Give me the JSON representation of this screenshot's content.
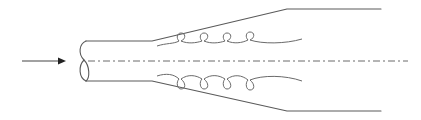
{
  "diagram": {
    "colors": {
      "stroke": "#5a5a5a",
      "coil": "#6a6a6a",
      "arrow": "#222222",
      "background": "#ffffff"
    },
    "flow_arrow": {
      "direction": "right",
      "x1": 22,
      "x2": 65,
      "y": 61
    },
    "pipe": {
      "inlet": {
        "x": 84,
        "top_y": 41,
        "bottom_y": 81,
        "cut": "wavy-section"
      },
      "straight_end_x": 152,
      "diverging_end_x": 287,
      "outlet_end_x": 381,
      "outlet_top_y": 9,
      "outlet_bottom_y": 111
    },
    "centerline": {
      "style": "dash-dot",
      "x1": 88,
      "x2": 408,
      "y": 61
    },
    "coils": {
      "top": {
        "loops": 4,
        "loop_x": [
          181,
          204,
          227,
          250
        ],
        "loop_y": 37
      },
      "bottom": {
        "loops": 4,
        "loop_x": [
          181,
          204,
          227,
          250
        ],
        "loop_y": 85
      }
    },
    "labels": []
  }
}
